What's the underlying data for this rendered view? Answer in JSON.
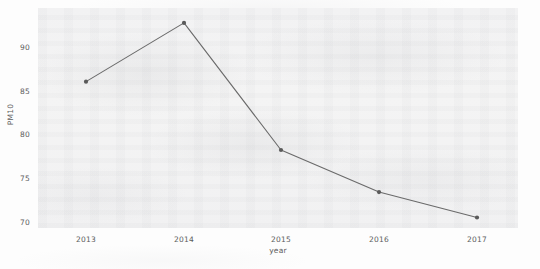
{
  "chart_data": {
    "type": "line",
    "title": "",
    "xlabel": "year",
    "ylabel": "PM10",
    "categories": [
      "2013",
      "2014",
      "2015",
      "2016",
      "2017"
    ],
    "values": [
      86.0,
      92.7,
      78.2,
      73.4,
      70.5
    ],
    "series": [
      {
        "name": "PM10",
        "values": [
          86.0,
          92.7,
          78.2,
          73.4,
          70.5
        ]
      }
    ],
    "xtick_labels": [
      "2013",
      "2014",
      "2015",
      "2016",
      "2017"
    ],
    "ytick_labels": [
      "70",
      "75",
      "80",
      "85",
      "90"
    ],
    "ytick_values": [
      70,
      75,
      80,
      85,
      90
    ],
    "ylim": [
      69.3,
      94.4
    ],
    "xlim": [
      2012.6,
      2017.4
    ],
    "grid": false,
    "legend": "none",
    "line_color": "#6a6a6a",
    "marker_color": "#5a5a5a",
    "panel_color": "#f2f2f3",
    "background_color": "#fdfdfd"
  },
  "axes": {
    "y_label": "PM10",
    "x_label": "year",
    "y_ticks": [
      "90",
      "85",
      "80",
      "75",
      "70"
    ],
    "x_ticks": [
      "2013",
      "2014",
      "2015",
      "2016",
      "2017"
    ]
  }
}
